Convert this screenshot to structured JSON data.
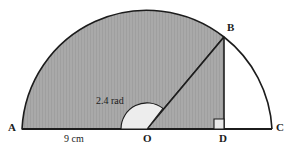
{
  "figure": {
    "type": "geometry-diagram",
    "background_color": "#ffffff",
    "stroke_color": "#1c1c1c",
    "shaded_fill_color": "#a8a8a8",
    "sector_angle_fill_color": "#ededed",
    "right_angle_fill_color": "#e8e8e8"
  },
  "labels": {
    "point_a": "A",
    "point_b": "B",
    "point_c": "C",
    "point_o": "O",
    "point_d": "D",
    "angle": "2.4 rad",
    "radius": "9 cm"
  },
  "geometry": {
    "center": {
      "x": 147,
      "y": 129
    },
    "radius_px": 125,
    "radius_value": "9 cm",
    "angle_rad": 2.4,
    "point_a": {
      "x": 22,
      "y": 129
    },
    "point_c": {
      "x": 272,
      "y": 129
    },
    "point_b": {
      "x": 224,
      "y": 37
    },
    "point_d": {
      "x": 224,
      "y": 129
    },
    "semicircle_apex": {
      "x": 147,
      "y": 8
    },
    "angle_arc_radius_px": 26,
    "right_angle_box_px": 10
  }
}
